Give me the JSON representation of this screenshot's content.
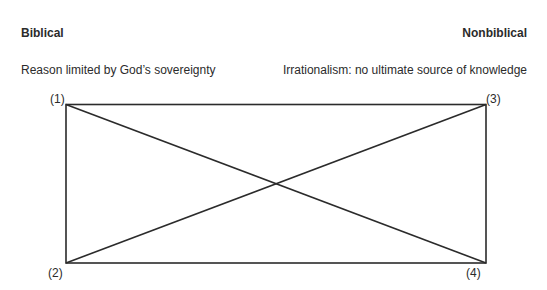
{
  "left": {
    "heading": "Biblical",
    "description": "Reason limited by God’s sovereignty"
  },
  "right": {
    "heading": "Nonbiblical",
    "description": "Irrationalism: no ultimate source of knowledge"
  },
  "corners": {
    "top_left": "(1)",
    "bottom_left": "(2)",
    "top_right": "(3)",
    "bottom_right": "(4)"
  },
  "diagram": {
    "type": "square-of-opposition",
    "line_color": "#2b2b2b"
  }
}
